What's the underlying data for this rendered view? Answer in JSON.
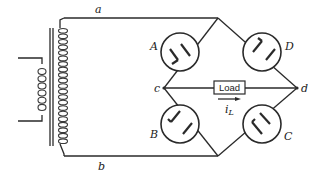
{
  "diagram": {
    "type": "full-wave bridge rectifier circuit",
    "transformer": {
      "primary_turns": 6,
      "secondary_turns": 21
    },
    "nodes": {
      "a": "a",
      "b": "b",
      "c": "c",
      "d": "d"
    },
    "tubes": [
      {
        "id": "A",
        "label": "A"
      },
      {
        "id": "B",
        "label": "B"
      },
      {
        "id": "C",
        "label": "C"
      },
      {
        "id": "D",
        "label": "D"
      }
    ],
    "load": {
      "label": "Load"
    },
    "current": {
      "symbol": "i",
      "subscript": "L"
    },
    "colors": {
      "line": "#2a2a2a",
      "background": "#ffffff"
    }
  }
}
